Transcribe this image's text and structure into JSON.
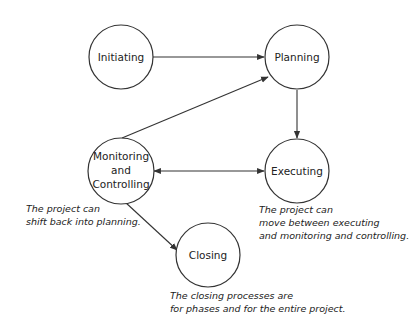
{
  "diagram": {
    "type": "process-group-flow",
    "nodes": [
      {
        "id": "initiating",
        "label_lines": [
          "Initiating"
        ]
      },
      {
        "id": "planning",
        "label_lines": [
          "Planning"
        ]
      },
      {
        "id": "monitoring",
        "label_lines": [
          "Monitoring",
          "and",
          "Controlling"
        ]
      },
      {
        "id": "executing",
        "label_lines": [
          "Executing"
        ]
      },
      {
        "id": "closing",
        "label_lines": [
          "Closing"
        ]
      }
    ],
    "edges": [
      {
        "from": "initiating",
        "to": "planning",
        "direction": "forward"
      },
      {
        "from": "planning",
        "to": "executing",
        "direction": "forward"
      },
      {
        "from": "monitoring",
        "to": "planning",
        "direction": "forward"
      },
      {
        "from": "monitoring",
        "to": "executing",
        "direction": "both"
      },
      {
        "from": "monitoring",
        "to": "closing",
        "direction": "forward"
      }
    ],
    "notes": {
      "monitoring": [
        "The project can",
        "shift back into planning."
      ],
      "executing": [
        "The project can",
        "move between executing",
        "and monitoring and controlling."
      ],
      "closing": [
        "The closing processes are",
        "for phases and for the entire project."
      ]
    }
  },
  "colors": {
    "stroke": "#333333",
    "text": "#222222",
    "background": "#ffffff"
  }
}
